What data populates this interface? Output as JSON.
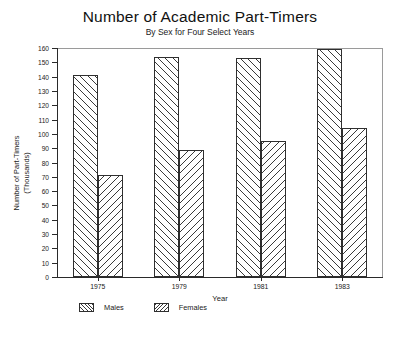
{
  "chart_data": {
    "type": "bar",
    "title": "Number of Academic Part-Timers",
    "subtitle": "By Sex for Four Select Years",
    "xlabel": "Year",
    "ylabel": "Number of Part-Timers",
    "ylabel_line2": "(Thousands)",
    "categories": [
      "1975",
      "1979",
      "1981",
      "1983"
    ],
    "series": [
      {
        "name": "Males",
        "values": [
          141,
          154,
          153,
          159
        ],
        "hatch": "diagonal-up"
      },
      {
        "name": "Females",
        "values": [
          71,
          89,
          95,
          104
        ],
        "hatch": "diagonal-down"
      }
    ],
    "ylim": [
      0,
      160
    ],
    "ytick_step": 10,
    "yticks": [
      0,
      10,
      20,
      30,
      40,
      50,
      60,
      70,
      80,
      90,
      100,
      110,
      120,
      130,
      140,
      150,
      160
    ],
    "ytick_labels": [
      "0",
      "10",
      "20",
      "30",
      "40",
      "50",
      "60",
      "70",
      "80",
      "90",
      "100",
      "110",
      "120",
      "130",
      "140",
      "150",
      "160"
    ],
    "grid": false,
    "legend_position": "bottom-left",
    "legend": [
      "Males",
      "Females"
    ],
    "bar_color": "#ffffff",
    "line_color": "#2f2f2f"
  }
}
